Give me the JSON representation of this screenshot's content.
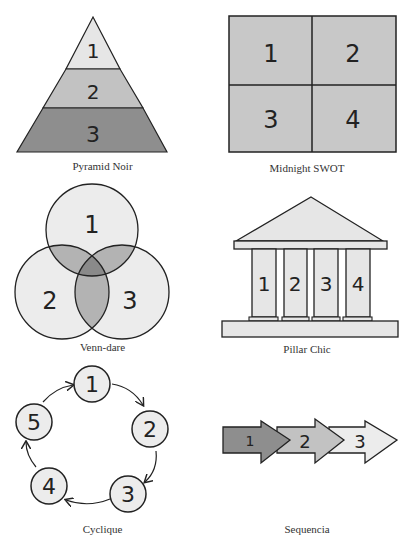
{
  "colors": {
    "stroke": "#222222",
    "light": "#e6e6e6",
    "mid": "#c2c2c2",
    "dark": "#8e8e8e",
    "swot_fill": "#c8c8c8",
    "venn_circle": "#ececec",
    "venn_pair": "#b3b3b3",
    "venn_center": "#8a8a8a"
  },
  "diagrams": [
    {
      "id": "pyramid",
      "caption": "Pyramid Noir",
      "labels": [
        "1",
        "2",
        "3"
      ]
    },
    {
      "id": "swot",
      "caption": "Midnight SWOT",
      "labels": [
        "1",
        "2",
        "3",
        "4"
      ]
    },
    {
      "id": "venn",
      "caption": "Venn-dare",
      "labels": [
        "1",
        "2",
        "3"
      ]
    },
    {
      "id": "pillar",
      "caption": "Pillar Chic",
      "labels": [
        "1",
        "2",
        "3",
        "4"
      ]
    },
    {
      "id": "cycle",
      "caption": "Cyclique",
      "labels": [
        "1",
        "2",
        "3",
        "4",
        "5"
      ]
    },
    {
      "id": "sequence",
      "caption": "Sequencia",
      "labels": [
        "1",
        "2",
        "3"
      ]
    }
  ]
}
